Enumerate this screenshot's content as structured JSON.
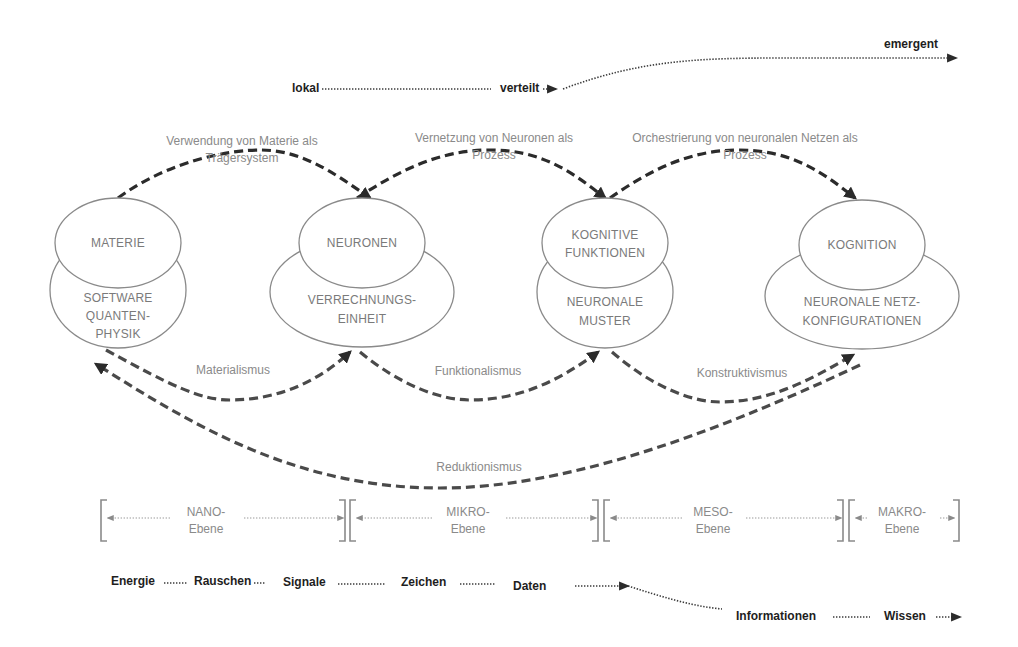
{
  "scale": {
    "lokal": "lokal",
    "verteilt": "verteilt",
    "emergent": "emergent"
  },
  "processes": [
    {
      "line1": "Verwendung von Materie als",
      "line2": "Trägersystem"
    },
    {
      "line1": "Vernetzung von Neuronen als",
      "line2": "Prozess"
    },
    {
      "line1": "Orchestrierung von neuronalen Netzen als",
      "line2": "Prozess"
    }
  ],
  "nodes": [
    {
      "top": [
        "MATERIE"
      ],
      "bottom": [
        "SOFTWARE",
        "QUANTEN-",
        "PHYSIK"
      ]
    },
    {
      "top": [
        "NEURONEN"
      ],
      "bottom": [
        "VERRECHNUNGS-",
        "EINHEIT"
      ]
    },
    {
      "top": [
        "KOGNITIVE",
        "FUNKTIONEN"
      ],
      "bottom": [
        "NEURONALE",
        "MUSTER"
      ]
    },
    {
      "top": [
        "KOGNITION"
      ],
      "bottom": [
        "NEURONALE NETZ-",
        "KONFIGURATIONEN"
      ]
    }
  ],
  "philosophies": {
    "materialismus": "Materialismus",
    "funktionalismus": "Funktionalismus",
    "konstruktivismus": "Konstruktivismus",
    "reduktionismus": "Reduktionismus"
  },
  "levels": [
    {
      "line1": "NANO-",
      "line2": "Ebene"
    },
    {
      "line1": "MIKRO-",
      "line2": "Ebene"
    },
    {
      "line1": "MESO-",
      "line2": "Ebene"
    },
    {
      "line1": "MAKRO-",
      "line2": "Ebene"
    }
  ],
  "chain": {
    "energie": "Energie",
    "rauschen": "Rauschen",
    "signale": "Signale",
    "zeichen": "Zeichen",
    "daten": "Daten",
    "informationen": "Informationen",
    "wissen": "Wissen"
  },
  "colors": {
    "arrow": "#2b2b2b",
    "node_text": "#7a7a7a",
    "label_text": "#8a8a8a",
    "dark_text": "#1e1e1e"
  }
}
